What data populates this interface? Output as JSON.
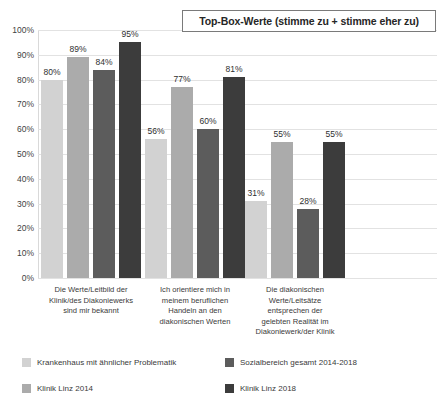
{
  "title": {
    "text": "Top-Box-Werte (stimme zu + stimme eher zu)"
  },
  "chart_data": {
    "type": "bar",
    "title": "Top-Box-Werte (stimme zu + stimme eher zu)",
    "xlabel": "",
    "ylabel": "",
    "ylim": [
      0,
      100
    ],
    "grid": true,
    "legend_position": "bottom",
    "value_suffix": "%",
    "ytick_labels": [
      "100%",
      "90%",
      "80%",
      "70%",
      "60%",
      "50%",
      "40%",
      "30%",
      "20%",
      "10%",
      "0%"
    ],
    "ytick_values": [
      100,
      90,
      80,
      70,
      60,
      50,
      40,
      30,
      20,
      10,
      0
    ],
    "categories": [
      "Die Werte/Leitbild der Klinik/des Diakoniewerks sind mir bekannt",
      "Ich orientiere mich in meinem beruflichen Handeln an den diakonischen Werten",
      "Die diakonischen Werte/Leitsätze entsprechen der gelebten Realität im Diakoniewerk/der Klinik"
    ],
    "category_lines": [
      [
        "Die Werte/Leitbild der",
        "Klinik/des Diakoniewerks",
        "sind mir bekannt"
      ],
      [
        "Ich orientiere mich in",
        "meinem beruflichen",
        "Handeln an den",
        "diakonischen Werten"
      ],
      [
        "Die diakonischen",
        "Werte/Leitsätze",
        "entsprechen der",
        "gelebten Realität im",
        "Diakoniewerk/der Klinik"
      ]
    ],
    "series": [
      {
        "name": "Krankenhaus mit ähnlicher Problematik",
        "color": "#d2d2d2",
        "values": [
          80,
          56,
          31
        ],
        "labels": [
          "80%",
          "56%",
          "31%"
        ]
      },
      {
        "name": "Klinik Linz 2014",
        "color": "#ababab",
        "values": [
          89,
          77,
          55
        ],
        "labels": [
          "89%",
          "77%",
          "55%"
        ]
      },
      {
        "name": "Sozialbereich gesamt 2014-2018",
        "color": "#5c5c5c",
        "values": [
          84,
          60,
          28
        ],
        "labels": [
          "84%",
          "60%",
          "28%"
        ]
      },
      {
        "name": "Klinik Linz 2018",
        "color": "#3c3c3c",
        "values": [
          95,
          81,
          55
        ],
        "labels": [
          "95%",
          "81%",
          "55%"
        ]
      }
    ]
  },
  "legend": {
    "items": [
      {
        "label": "Krankenhaus mit ähnlicher Problematik",
        "color": "#d2d2d2"
      },
      {
        "label": "Sozialbereich gesamt 2014-2018",
        "color": "#5c5c5c"
      },
      {
        "label": "Klinik Linz 2014",
        "color": "#ababab"
      },
      {
        "label": "Klinik Linz 2018",
        "color": "#3c3c3c"
      }
    ]
  }
}
